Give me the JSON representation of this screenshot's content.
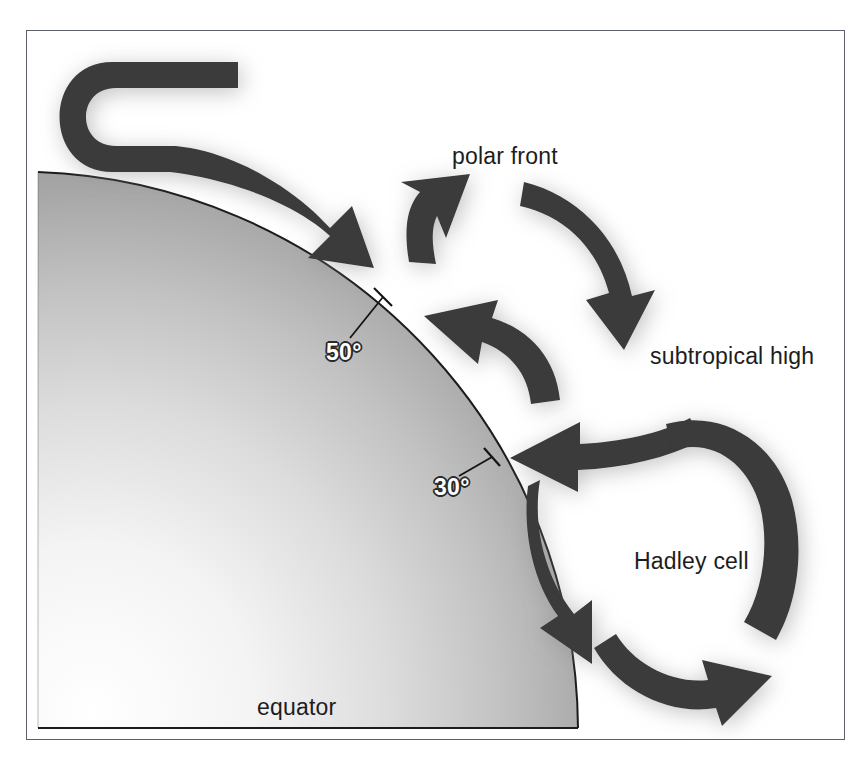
{
  "figure": {
    "kind": "atmospheric-circulation-diagram",
    "frame": {
      "border_color": "#5c6068",
      "background": "#ffffff"
    }
  },
  "colors": {
    "arrow_fill": "#3a3a3a",
    "globe_edge": "#1a1a1a",
    "globe_light": "#fdfdfd",
    "globe_dark": "#8e8e8e",
    "label_dark": "#1d1d1d",
    "label_white": "#ffffff",
    "shadow": "#9a9a9a"
  },
  "labels": {
    "polar_front": "polar front",
    "subtropical_high": "subtropical high",
    "hadley_cell": "Hadley cell",
    "equator": "equator",
    "latitude_50": "50°",
    "latitude_30": "30°"
  },
  "globe": {
    "name": "earth-quadrant",
    "description": "shaded quarter-sphere with curved limb, equator along the bottom",
    "tick_latitudes": [
      "50°",
      "30°"
    ]
  },
  "cells": [
    {
      "name": "polar-cell",
      "label": "",
      "direction": "clockwise",
      "arrowheads": 1,
      "position": "upper-left"
    },
    {
      "name": "ferrel-cell",
      "label": "",
      "direction": "counterclockwise",
      "arrowheads": 3,
      "position": "middle"
    },
    {
      "name": "hadley-cell",
      "label": "Hadley cell",
      "direction": "clockwise",
      "arrowheads": 3,
      "position": "lower-right"
    }
  ]
}
